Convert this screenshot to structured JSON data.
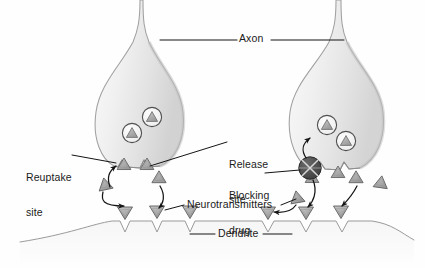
{
  "figure": {
    "background_color": "#fefefe",
    "line_color": "#1b1b1b",
    "membrane_color": "#8a8a8a",
    "cell_fill": "#f2f2f2",
    "cell_shade": "#d9d9d9",
    "vesicle_stroke": "#4a4a4a",
    "transmitter_fill": "#a9a9a9",
    "transmitter_stroke": "#5a5a5a",
    "drug_fill": "#4d4d4d",
    "drug_stroke": "#2b2b2b",
    "drug_cross_color": "#e8e8e8"
  },
  "labels": {
    "axon": "Axon",
    "reuptake_site_line1": "Reuptake",
    "reuptake_site_line2": "site",
    "release_site_line1": "Release",
    "release_site_line2": "site",
    "blocking_drug_line1": "Blocking",
    "blocking_drug_line2": "drug",
    "neurotransmitters": "Neurotransmitters",
    "dendrite": "Dendrite"
  },
  "elements": {
    "left_terminal": "left-axon-terminal",
    "right_terminal": "right-axon-terminal",
    "vesicles_left": 2,
    "vesicles_right": 2,
    "transmitters_left": 7,
    "transmitters_right": 7,
    "receptor_notches_left": 3,
    "receptor_notches_right": 3,
    "blocking_drug_count": 1
  }
}
